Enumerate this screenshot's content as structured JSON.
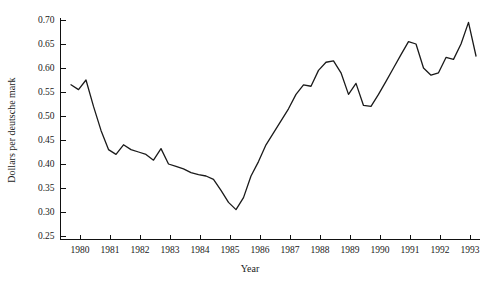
{
  "figure": {
    "top_note": "",
    "background_color": "#ffffff",
    "line_color": "#1a1a1a",
    "axis_color": "#111111"
  },
  "chart_data": {
    "type": "line",
    "title": "",
    "xlabel": "Year",
    "ylabel": "Dollars per deutsche mark",
    "xlim": [
      1979.6,
      1993.4
    ],
    "ylim": [
      0.25,
      0.7
    ],
    "grid": false,
    "legend": null,
    "xticks": [
      1980,
      1981,
      1982,
      1983,
      1984,
      1985,
      1986,
      1987,
      1988,
      1989,
      1990,
      1991,
      1992,
      1993
    ],
    "xtick_labels": [
      "1980",
      "1981",
      "1982",
      "1983",
      "1984",
      "1985",
      "1986",
      "1987",
      "1988",
      "1989",
      "1990",
      "1991",
      "1992",
      "1993"
    ],
    "yticks": [
      0.25,
      0.3,
      0.35,
      0.4,
      0.45,
      0.5,
      0.55,
      0.6,
      0.65,
      0.7
    ],
    "ytick_labels": [
      "0.25",
      "0.30",
      "0.35",
      "0.40",
      "0.45",
      "0.50",
      "0.55",
      "0.60",
      "0.65",
      "0.70"
    ],
    "series": [
      {
        "name": "Dollars per deutsche mark",
        "x": [
          1979.7,
          1979.95,
          1980.2,
          1980.45,
          1980.7,
          1980.95,
          1981.2,
          1981.45,
          1981.7,
          1981.95,
          1982.2,
          1982.45,
          1982.7,
          1982.95,
          1983.2,
          1983.45,
          1983.7,
          1983.95,
          1984.2,
          1984.45,
          1984.7,
          1984.95,
          1985.2,
          1985.45,
          1985.7,
          1985.95,
          1986.2,
          1986.45,
          1986.7,
          1986.95,
          1987.2,
          1987.45,
          1987.7,
          1987.95,
          1988.2,
          1988.45,
          1988.7,
          1988.95,
          1989.2,
          1989.45,
          1989.7,
          1989.95,
          1990.2,
          1990.45,
          1990.7,
          1990.95,
          1991.2,
          1991.45,
          1991.7,
          1991.95,
          1992.2,
          1992.45,
          1992.7,
          1992.95,
          1993.2
        ],
        "y": [
          0.565,
          0.555,
          0.575,
          0.52,
          0.47,
          0.43,
          0.42,
          0.44,
          0.43,
          0.425,
          0.42,
          0.408,
          0.432,
          0.4,
          0.395,
          0.39,
          0.382,
          0.378,
          0.375,
          0.368,
          0.345,
          0.32,
          0.305,
          0.33,
          0.375,
          0.405,
          0.44,
          0.465,
          0.49,
          0.515,
          0.545,
          0.565,
          0.562,
          0.595,
          0.612,
          0.615,
          0.59,
          0.545,
          0.568,
          0.522,
          0.52,
          0.545,
          0.572,
          0.6,
          0.628,
          0.655,
          0.65,
          0.6,
          0.585,
          0.59,
          0.622,
          0.618,
          0.65,
          0.695,
          0.625
        ]
      }
    ]
  }
}
